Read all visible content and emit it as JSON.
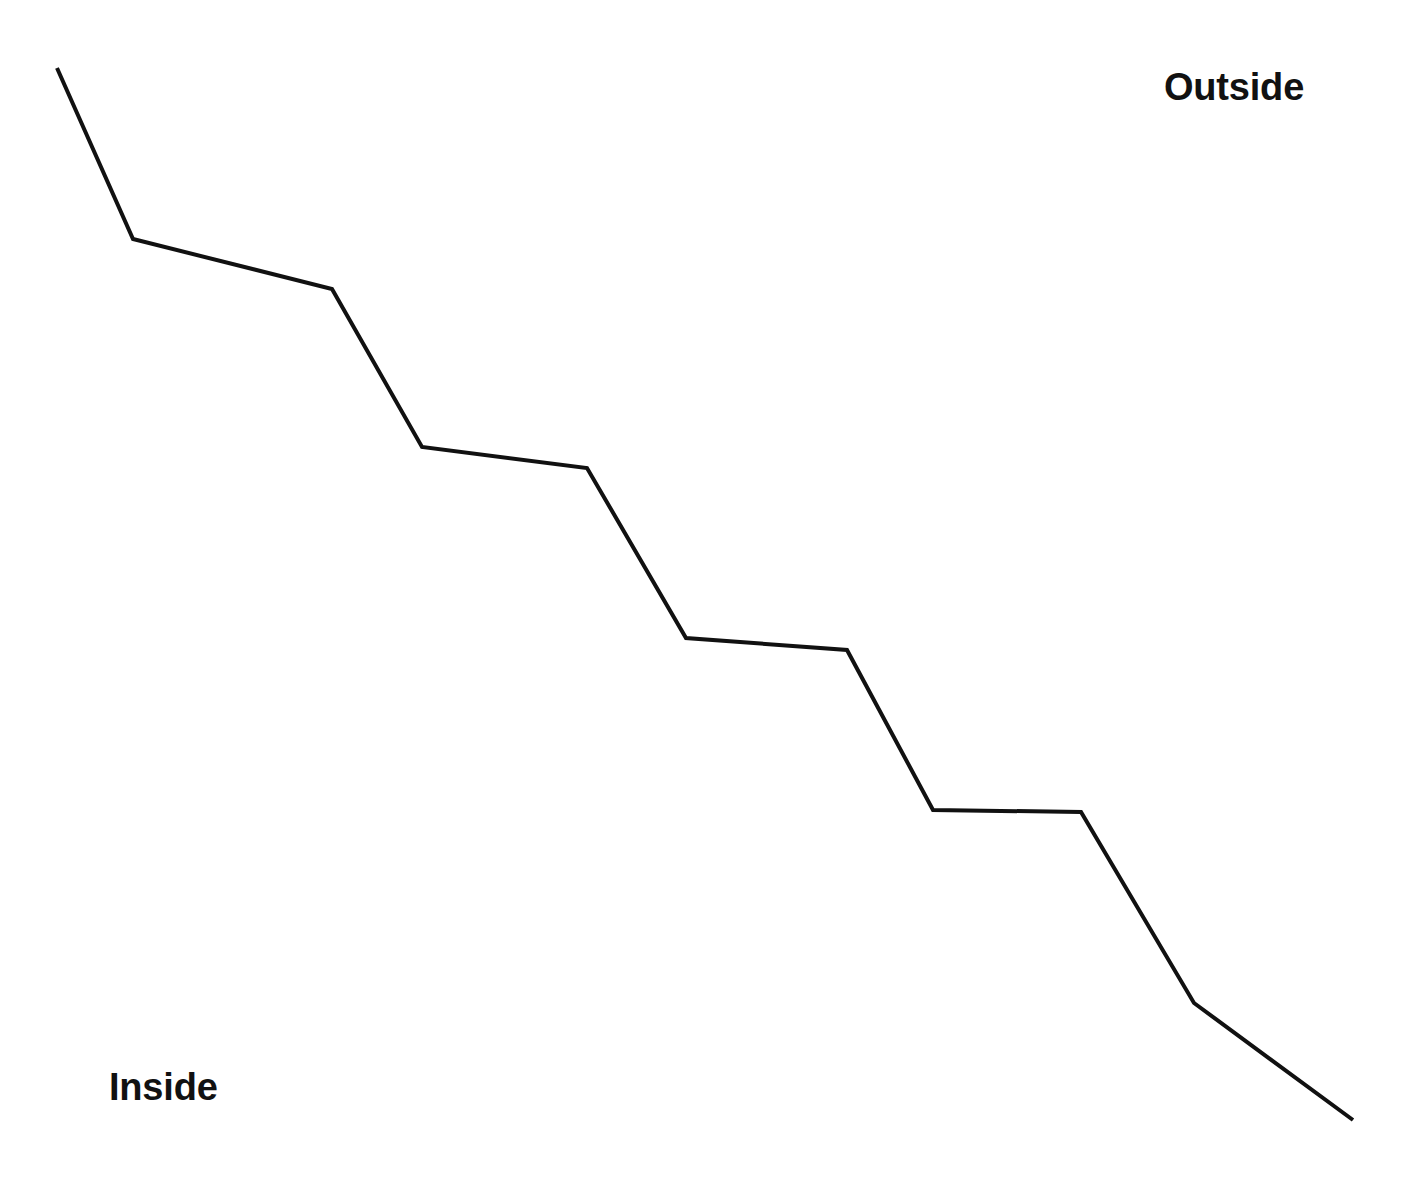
{
  "diagram": {
    "title": "",
    "background_color": "#ffffff",
    "width": 1402,
    "height": 1179,
    "labels": {
      "outside": "Outside",
      "inside": "Inside"
    },
    "boundary": {
      "name": "stepped-boundary-line",
      "stroke_color": "#111111",
      "stroke_width": 4,
      "fill": "none",
      "line_join": "miter",
      "line_cap": "butt",
      "description": "Descending staircase-like polyline separating the Inside region (lower left) from the Outside region (upper right)",
      "points": [
        [
          57,
          68
        ],
        [
          133,
          239
        ],
        [
          332,
          289
        ],
        [
          422,
          447
        ],
        [
          587,
          468
        ],
        [
          686,
          638
        ],
        [
          847,
          650
        ],
        [
          933,
          810
        ],
        [
          1081,
          812
        ],
        [
          1194,
          1003
        ],
        [
          1353,
          1120
        ]
      ],
      "points_string": "57,68 133,239 332,289 422,447 587,468 686,638 847,650 933,810 1081,812 1194,1003 1353,1120",
      "segment_count": 10
    }
  },
  "chart_data": {
    "type": "line",
    "title": "",
    "xlabel": "",
    "ylabel": "",
    "xlim": [
      0,
      1402
    ],
    "ylim": [
      0,
      1179
    ],
    "grid": false,
    "legend": "none",
    "series": [
      {
        "name": "boundary",
        "color": "#111111",
        "x": [
          57,
          133,
          332,
          422,
          587,
          686,
          847,
          933,
          1081,
          1194,
          1353
        ],
        "y": [
          68,
          239,
          289,
          447,
          468,
          638,
          650,
          810,
          812,
          1003,
          1120
        ]
      }
    ],
    "annotations": [
      {
        "text": "Outside",
        "x": 1164,
        "y": 68,
        "bold": true
      },
      {
        "text": "Inside",
        "x": 109,
        "y": 1068,
        "bold": true
      }
    ]
  }
}
